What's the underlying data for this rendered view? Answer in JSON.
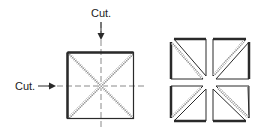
{
  "diagram": {
    "labels": {
      "top_cut": "Cut.",
      "left_cut": "Cut."
    },
    "colors": {
      "outline": "#2a2a2a",
      "dashed": "#8a8a8a",
      "hatch": "#9a9a9a"
    },
    "left_figure": {
      "description": "Square block with X seam lines, cut vertically and horizontally through center",
      "pieces_count": 1
    },
    "right_figure": {
      "description": "Resulting four quarter pieces, each with one diagonal seam",
      "pieces_count": 4
    }
  }
}
